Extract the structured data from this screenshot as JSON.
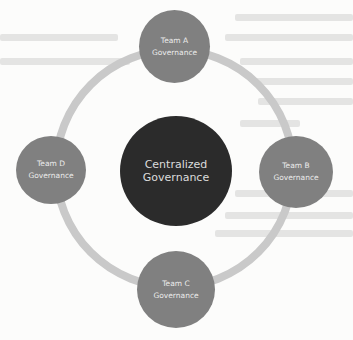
{
  "diagram": {
    "type": "hub-and-ring",
    "center": {
      "line1": "Centralized",
      "line2": "Governance",
      "color": "#2b2b2b"
    },
    "ring_color": "#c9c9c9",
    "node_color": "#808080",
    "nodes": [
      {
        "position": "top",
        "line1": "Team A",
        "line2": "Governance"
      },
      {
        "position": "right",
        "line1": "Team B",
        "line2": "Governance"
      },
      {
        "position": "bottom",
        "line1": "Team C",
        "line2": "Governance"
      },
      {
        "position": "left",
        "line1": "Team D",
        "line2": "Governance"
      }
    ]
  }
}
